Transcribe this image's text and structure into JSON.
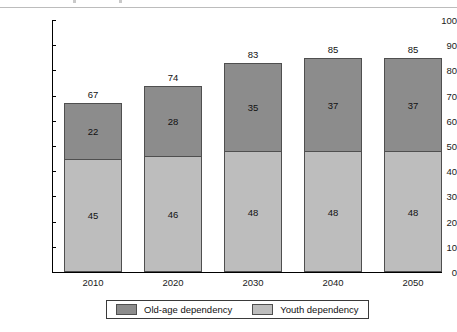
{
  "chart_data": {
    "type": "bar",
    "stacked": true,
    "title": "",
    "subtitle": "",
    "xlabel": "",
    "ylabel": "",
    "categories": [
      "2010",
      "2020",
      "2030",
      "2040",
      "2050"
    ],
    "series": [
      {
        "name": "Youth dependency",
        "color": "#bdbdbd",
        "values": [
          45,
          46,
          48,
          48,
          48
        ]
      },
      {
        "name": "Old-age dependency",
        "color": "#8c8c8c",
        "values": [
          22,
          28,
          35,
          37,
          37
        ]
      }
    ],
    "totals": [
      67,
      74,
      83,
      85,
      85
    ],
    "ylim": [
      0,
      100
    ],
    "ytick_labels": [
      "0",
      "10",
      "20",
      "30",
      "40",
      "50",
      "60",
      "70",
      "80",
      "90",
      "100"
    ],
    "ytick_values": [
      0,
      10,
      20,
      30,
      40,
      50,
      60,
      70,
      80,
      90,
      100
    ],
    "grid": false,
    "legend_position": "bottom",
    "legend_order": [
      "Old-age dependency",
      "Youth dependency"
    ]
  },
  "colors": {
    "old_age": "#8c8c8c",
    "youth": "#bdbdbd",
    "bar_outline": "#4f4f4f",
    "axis": "#000000",
    "text": "#111111",
    "background": "#ffffff"
  },
  "legend": {
    "items": [
      {
        "label": "Old-age dependency",
        "swatch": "#8c8c8c"
      },
      {
        "label": "Youth dependency",
        "swatch": "#bdbdbd"
      }
    ]
  }
}
